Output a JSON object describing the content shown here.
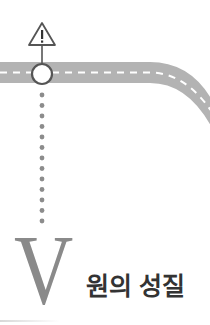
{
  "section": {
    "number_letter": "V",
    "title": "원의 성질"
  },
  "graphic": {
    "road_color": "#b3b3b3",
    "dash_color": "#ffffff",
    "marker_circle_fill": "#ffffff",
    "marker_circle_stroke": "#555555",
    "dots_color": "#8c8c8c",
    "warning_icon": "warning-triangle-icon",
    "warning_glyph": "!"
  },
  "colors": {
    "background": "#ffffff",
    "letter": "#8a8a8a",
    "title": "#333333"
  }
}
